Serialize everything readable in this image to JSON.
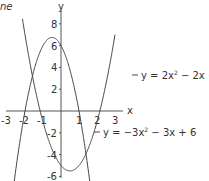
{
  "chart_data": {
    "type": "line",
    "title": "",
    "corner_text": "ne",
    "xlabel": "x",
    "ylabel": "y",
    "xlim": [
      -3,
      3
    ],
    "ylim": [
      -6,
      8
    ],
    "x_ticks": [
      "-3",
      "-2",
      "-1",
      "1",
      "2",
      "3"
    ],
    "y_ticks": [
      "8",
      "6",
      "4",
      "2",
      "-2",
      "-4",
      "-6"
    ],
    "grid": false,
    "series": [
      {
        "name": "y = 2x² − 2x − 5",
        "label_main": "y = 2x",
        "label_exp": "2",
        "label_tail": " − 2x − 5",
        "a": 2,
        "b": -2,
        "c": -5
      },
      {
        "name": "y = −3x² − 3x + 6",
        "label_main": "y = −3x",
        "label_exp": "2",
        "label_tail": " − 3x + 6",
        "a": -3,
        "b": -3,
        "c": 6
      }
    ]
  }
}
